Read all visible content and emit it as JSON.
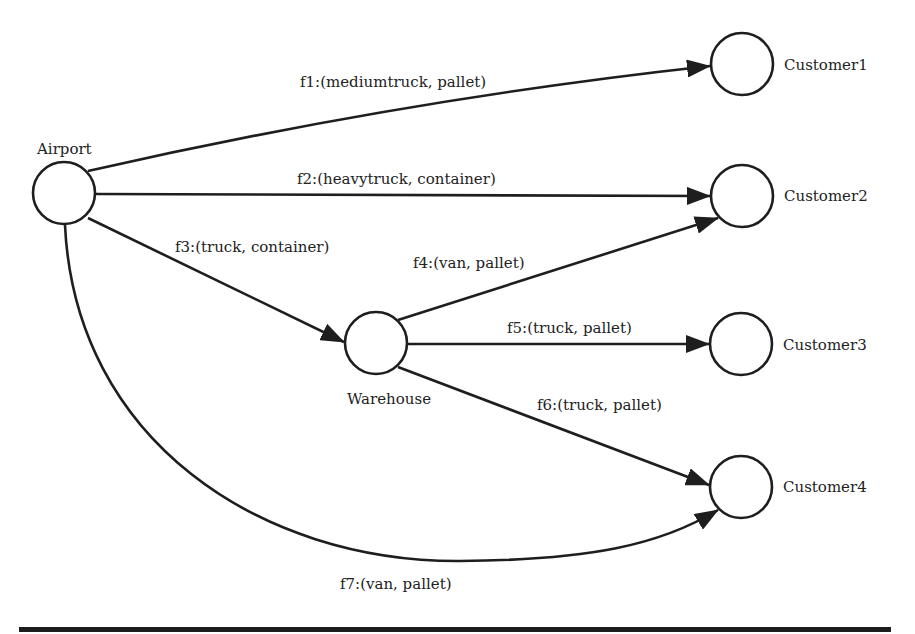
{
  "diagram": {
    "type": "directed-graph",
    "nodes": {
      "airport": {
        "label": "Airport"
      },
      "warehouse": {
        "label": "Warehouse"
      },
      "customer1": {
        "label": "Customer1"
      },
      "customer2": {
        "label": "Customer2"
      },
      "customer3": {
        "label": "Customer3"
      },
      "customer4": {
        "label": "Customer4"
      }
    },
    "edges": [
      {
        "id": "f1",
        "from": "Airport",
        "to": "Customer1",
        "label": "f1:(mediumtruck, pallet)"
      },
      {
        "id": "f2",
        "from": "Airport",
        "to": "Customer2",
        "label": "f2:(heavytruck, container)"
      },
      {
        "id": "f3",
        "from": "Airport",
        "to": "Warehouse",
        "label": "f3:(truck, container)"
      },
      {
        "id": "f4",
        "from": "Warehouse",
        "to": "Customer2",
        "label": "f4:(van, pallet)"
      },
      {
        "id": "f5",
        "from": "Warehouse",
        "to": "Customer3",
        "label": "f5:(truck, pallet)"
      },
      {
        "id": "f6",
        "from": "Warehouse",
        "to": "Customer4",
        "label": "f6:(truck, pallet)"
      },
      {
        "id": "f7",
        "from": "Airport",
        "to": "Customer4",
        "label": "f7:(van, pallet)"
      }
    ],
    "colors": {
      "stroke": "#1e1e1e",
      "text": "#222222",
      "background": "#ffffff"
    }
  }
}
